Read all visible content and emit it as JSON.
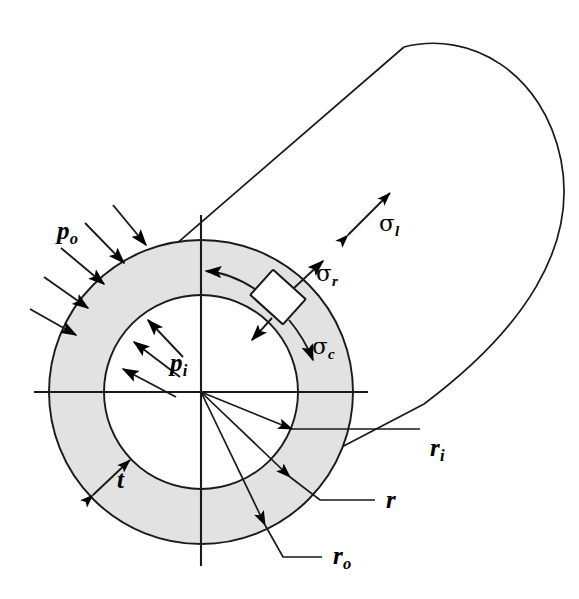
{
  "figure": {
    "colors": {
      "wall_fill": "#e2e2e2",
      "line": "#000000",
      "background": "#ffffff",
      "element_fill": "#ffffff"
    },
    "geometry": {
      "center_x": 201,
      "center_y": 392,
      "r_inner_px": 97,
      "r_outer_px": 152,
      "wall_thickness_px": 55,
      "axis_h_x1": 34,
      "axis_h_x2": 368,
      "axis_v_y1": 215,
      "axis_v_y2": 566
    }
  },
  "labels": {
    "p_outer": {
      "base": "p",
      "sub": "o"
    },
    "p_inner": {
      "base": "p",
      "sub": "i"
    },
    "sigma_radial": {
      "base": "σ",
      "sub": "r"
    },
    "sigma_circumferential": {
      "base": "σ",
      "sub": "c"
    },
    "sigma_longitudinal": {
      "base": "σ",
      "sub": "l"
    },
    "thickness": {
      "base": "t",
      "sub": ""
    },
    "radius_inner": {
      "base": "r",
      "sub": "i"
    },
    "radius_generic": {
      "base": "r",
      "sub": ""
    },
    "radius_outer": {
      "base": "r",
      "sub": "o"
    }
  },
  "annotations": {
    "external_pressure": {
      "name": "external pressure",
      "symbol": "p_o",
      "direction": "inward",
      "arrow_count": 5
    },
    "internal_pressure": {
      "name": "internal pressure",
      "symbol": "p_i",
      "direction": "outward",
      "arrow_count": 3
    },
    "radial_stress": {
      "name": "radial stress",
      "symbol": "sigma_r",
      "direction": "outward radial"
    },
    "circumferential_stress": {
      "name": "circumferential (hoop) stress",
      "symbol": "sigma_c",
      "direction": "tangential both ways"
    },
    "longitudinal_stress": {
      "name": "longitudinal stress",
      "symbol": "sigma_l",
      "direction": "double headed along axis"
    },
    "stress_element": {
      "name": "differential stress element",
      "shape": "square",
      "rotation_deg": 45
    }
  }
}
